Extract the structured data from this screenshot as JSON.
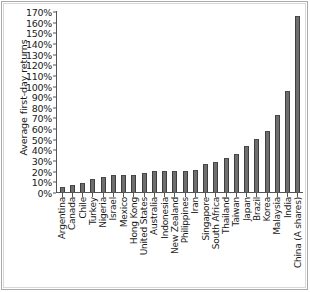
{
  "chart_data": {
    "type": "bar",
    "title": "",
    "xlabel": "",
    "ylabel": "Average first-day returns",
    "ylim": [
      0,
      170
    ],
    "ytick_labels": [
      "170%",
      "160%",
      "150%",
      "140%",
      "130%",
      "120%",
      "110%",
      "100%",
      "90%",
      "80%",
      "70%",
      "60%",
      "50%",
      "40%",
      "30%",
      "20%",
      "10%",
      "0%"
    ],
    "ytick_values": [
      170,
      160,
      150,
      140,
      130,
      120,
      110,
      100,
      90,
      80,
      70,
      60,
      50,
      40,
      30,
      20,
      10,
      0
    ],
    "grid": false,
    "legend": "none",
    "categories": [
      "Argentina",
      "Canada",
      "Chile",
      "Turkey",
      "Nigeria",
      "Israel",
      "Mexico",
      "Hong Kong",
      "United States",
      "Australia",
      "Indonesia",
      "New Zealand",
      "Philippines",
      "Iran",
      "Singapore",
      "South Africa",
      "Thailand",
      "Taiwan",
      "Japan",
      "Brazil",
      "Korea",
      "Malaysia",
      "India",
      "China (A shares)"
    ],
    "values": [
      5,
      7,
      8,
      12,
      14,
      16,
      16,
      16,
      18,
      20,
      20,
      20,
      20,
      21,
      26,
      28,
      32,
      36,
      43,
      50,
      57,
      72,
      95,
      165
    ],
    "bar_color": "#6e6e6e",
    "bar_edge_color": "#3f3f3f",
    "background_color": "#ffffff",
    "axis_color": "#555555"
  }
}
